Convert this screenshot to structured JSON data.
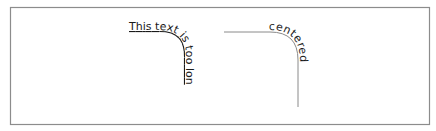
{
  "figure": {
    "frame": {
      "stroke_color": "#8c8c8c",
      "fill_color": "#ffffff"
    },
    "left_sample": {
      "text": "This text is too lon",
      "decoration": "underline",
      "path_visible": false,
      "text_color": "#1a1a1a"
    },
    "right_sample": {
      "text": "centered",
      "alignment": "middle",
      "path_visible": true,
      "path_color": "#8a8a8a",
      "text_color": "#1a1a1a"
    }
  }
}
